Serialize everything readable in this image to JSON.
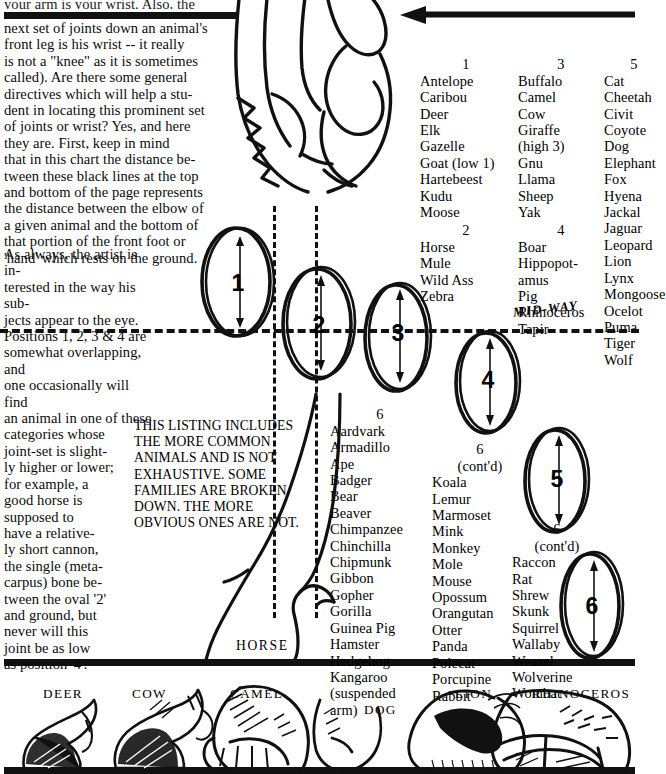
{
  "page": {
    "clipped_top_line": "your arm is your wrist.  Also, the",
    "paragraph_1": "next set of joints down an animal's\nfront leg is his wrist -- it really\nis not a \"knee\" as it is sometimes\ncalled).   Are there some general\ndirectives which will help a stu-\ndent in locating this prominent set\nof joints or wrist?  Yes, and here\nthey are.  First, keep in mind\nthat in this chart the distance be-\ntween these black lines at the top\nand bottom of the page represents\nthe distance between the elbow of\na given animal and the bottom of\nthat portion of the front foot or\n'hand' which rests on the ground.",
    "paragraph_2": "As always, the artist is in-\nterested in the way his sub-\njects appear to the eye.\nPositions 1, 2, 3 & 4 are\nsomewhat overlapping, and\none occasionally will find\nan animal in one of these\ncategories whose\njoint-set is slight-\nly higher or lower;\nfor example, a\ngood horse is\nsupposed to\nhave a relative-\nly short cannon,\nthe single (meta-\ncarpus) bone be-\ntween the oval '2'\nand ground, but\nnever will this\njoint be as low\nas position '4'.",
    "listing_note": "THIS LISTING INCLUDES\nTHE MORE COMMON\nANIMALS AND IS NOT\nEXHAUSTIVE.  SOME\nFAMILIES ARE BROKEN\nDOWN.  THE MORE\nOBVIOUS ONES ARE NOT.",
    "midway_label": "MID-WAY",
    "horse_label": "HORSE"
  },
  "lists": {
    "group1": {
      "heading": "1",
      "animals": "Antelope\nCaribou\nDeer\nElk\nGazelle\nGoat (low 1)\nHartebeest\nKudu\nMoose"
    },
    "group2": {
      "heading": "2",
      "animals": "Horse\nMule\nWild Ass\nZebra"
    },
    "group3": {
      "heading": "3",
      "animals": "Buffalo\nCamel\nCow\nGiraffe\n  (high 3)\nGnu\nLlama\nSheep\nYak"
    },
    "group4": {
      "heading": "4",
      "animals": "Boar\nHippopot-\n   amus\nPig\nRhinoceros\nTapir"
    },
    "group5": {
      "heading": "5",
      "animals": "Cat\nCheetah\nCivit\nCoyote\nDog\nElephant\nFox\nHyena\nJackal\nJaguar\nLeopard\nLion\nLynx\nMongoose\nOcelot\nPuma\nTiger\nWolf"
    },
    "group6a": {
      "heading": "6",
      "animals": "Aardvark\nArmadillo\nApe\nBadger\nBear\nBeaver\nChimpanzee\nChinchilla\nChipmunk\nGibbon\nGopher\nGorilla\nGuinea Pig\nHamster\nHedgehog\nKangaroo\n (suspended\n   arm)"
    },
    "group6b": {
      "heading": "6",
      "cont": "(cont'd)",
      "animals": "Koala\nLemur\nMarmoset\nMink\nMonkey\nMole\nMouse\nOpossum\nOrangutan\nOtter\nPanda\nPolecat\nPorcupine\nRabbit"
    },
    "group6c": {
      "heading": "6",
      "cont": "(cont'd)",
      "animals": "Raccon\nRat\nShrew\nSkunk\nSquirrel\nWallaby\nWeasel\nWolverine\nWombat"
    }
  },
  "ovals": [
    {
      "label": "1"
    },
    {
      "label": "2"
    },
    {
      "label": "3"
    },
    {
      "label": "4"
    },
    {
      "label": "5"
    },
    {
      "label": "6"
    }
  ],
  "foot_labels": [
    {
      "label": "DEER"
    },
    {
      "label": "COW"
    },
    {
      "label": "CAMEL"
    },
    {
      "label": "DOG"
    },
    {
      "label": "LION"
    },
    {
      "label": "RHINOCEROS"
    }
  ],
  "colors": {
    "ink": "#111111",
    "paper": "#ffffff"
  }
}
